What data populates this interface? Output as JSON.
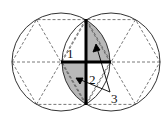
{
  "diagram": {
    "colors": {
      "stroke": "#333333",
      "dash": "#555555",
      "shade": "#b8b8b8",
      "bold": "#000000",
      "background": "#ffffff"
    },
    "circles": [
      {
        "name": "left-circle",
        "cx": 61,
        "cy": 62,
        "r": 49
      },
      {
        "name": "right-circle",
        "cx": 111,
        "cy": 62,
        "r": 49
      }
    ],
    "labels": {
      "region1": "1",
      "region2": "2",
      "pointer3": "3"
    }
  }
}
